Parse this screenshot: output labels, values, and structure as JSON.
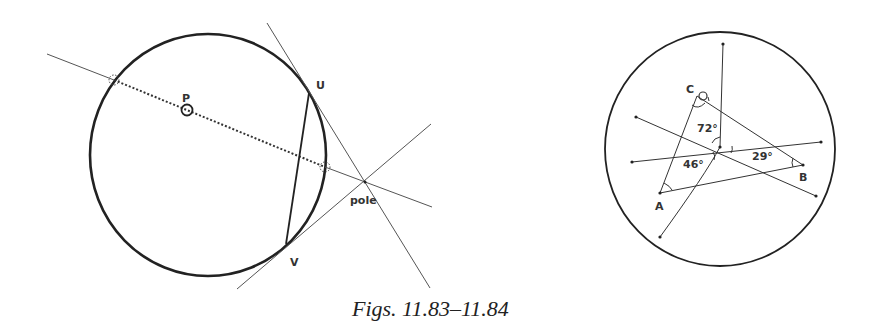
{
  "caption": "Figs. 11.83–11.84",
  "figure_left": {
    "circle": {
      "cx": 208,
      "cy": 155,
      "rx": 118,
      "ry": 121
    },
    "center_label": "P",
    "center_marker": {
      "x": 187,
      "y": 110
    },
    "point_U_label": "U",
    "point_V_label": "V",
    "pole_label": "pole",
    "points": {
      "P": [
        187,
        110
      ],
      "U": [
        309,
        93
      ],
      "V": [
        286,
        244
      ],
      "pole": [
        365,
        182
      ],
      "left_int": [
        114,
        80
      ],
      "right_int": [
        325,
        167
      ]
    },
    "lines": [
      {
        "id": "polar-line",
        "from": [
          47,
          54
        ],
        "to": [
          432,
          207
        ]
      },
      {
        "id": "tangent-U",
        "from": [
          267,
          23
        ],
        "to": [
          430,
          288
        ]
      },
      {
        "id": "tangent-V",
        "from": [
          237,
          289
        ],
        "to": [
          431,
          124
        ]
      }
    ]
  },
  "figure_right": {
    "circle": {
      "cx": 720,
      "cy": 149,
      "rx": 115,
      "ry": 117
    },
    "label_A": "A",
    "label_B": "B",
    "label_C": "C",
    "angle_72": "72°",
    "angle_46": "46°",
    "angle_29": "29°",
    "points": {
      "O": [
        720,
        147
      ],
      "A": [
        660,
        193
      ],
      "B": [
        803,
        165
      ],
      "C": [
        697,
        96
      ]
    }
  }
}
